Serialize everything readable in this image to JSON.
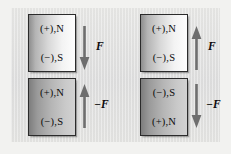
{
  "figure": {
    "type": "physics-diagram",
    "background_color": "#f2f2f0",
    "panel_color": "#e2e2e0"
  },
  "left_pair": {
    "description": "attracting magnet pair",
    "top_magnet": {
      "shade": "light",
      "top_pole": "(+),N",
      "bottom_pole": "(−),S"
    },
    "bottom_magnet": {
      "shade": "dark",
      "top_pole": "(+),N",
      "bottom_pole": "(−),S"
    },
    "top_arrow": {
      "direction": "down",
      "label": "F"
    },
    "bottom_arrow": {
      "direction": "up",
      "label": "−F"
    }
  },
  "right_pair": {
    "description": "repelling magnet pair",
    "top_magnet": {
      "shade": "light",
      "top_pole": "(+),N",
      "bottom_pole": "(−),S"
    },
    "bottom_magnet": {
      "shade": "dark",
      "top_pole": "(−),S",
      "bottom_pole": "(+),N"
    },
    "top_arrow": {
      "direction": "up",
      "label": "F"
    },
    "bottom_arrow": {
      "direction": "down",
      "label": "−F"
    }
  },
  "colors": {
    "arrow": "#6e6e6e",
    "magnet_border": "#2b2b2b",
    "text": "#0a0a0a"
  }
}
